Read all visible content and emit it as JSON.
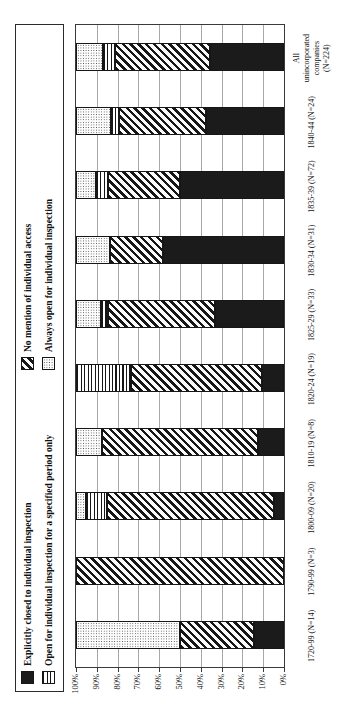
{
  "colors": {
    "pattern_ink": "#161616",
    "bar_black": "#1b1b1b",
    "gridline": "#a8a8a8",
    "plot_border": "#3a3a3a",
    "background": "#ffffff"
  },
  "chart_data": {
    "type": "bar",
    "variant": "100pct-stacked-columns",
    "orientation": "landscape chart rotated 90deg counter-clockwise within portrait image",
    "title": "",
    "xlabel": "",
    "ylabel": "",
    "ylim": [
      0,
      100
    ],
    "grid": true,
    "legend_position": "top",
    "categories": [
      "1720-99 (N=14)",
      "1790-99 (N=3)",
      "1800-09 (N=20)",
      "1810-19 (N=8)",
      "1820-24 (N=19)",
      "1825-29 (N=33)",
      "1830-34 (N=31)",
      "1835-39 (N=72)",
      "1840-44 (N=24)",
      "All unincorporated companies (N=224)"
    ],
    "series": [
      {
        "name": "Explicitly closed to individual inspection",
        "pattern": "solid-black",
        "values": [
          14.3,
          0,
          5,
          12.5,
          10.5,
          33.3,
          58.1,
          50,
          37.5,
          35.7
        ]
      },
      {
        "name": "No mention of individual access",
        "pattern": "diagonal-hatch",
        "values": [
          35.7,
          100,
          80,
          75,
          63.2,
          51.5,
          25.8,
          34.7,
          41.7,
          45.5
        ]
      },
      {
        "name": "Open for individual inspection for a specified period only",
        "pattern": "horizontal-lines",
        "values": [
          0,
          0,
          10,
          0,
          26.3,
          3,
          0,
          5.6,
          4.2,
          5.8
        ]
      },
      {
        "name": "Always open for individual inspection",
        "pattern": "fine-dots",
        "values": [
          50,
          0,
          5,
          12.5,
          0,
          12.1,
          16.1,
          9.7,
          16.7,
          12.9
        ]
      }
    ],
    "stack_order_bottom_to_top": [
      0,
      1,
      2,
      3
    ],
    "y_axis": {
      "ticks_top_to_bottom": [
        "100%",
        "90%",
        "80%",
        "70%",
        "60%",
        "50%",
        "40%",
        "30%",
        "20%",
        "10%",
        "0%"
      ]
    },
    "legend_layout": {
      "column1_series": [
        0,
        2
      ],
      "column2_series": [
        1,
        3
      ]
    }
  }
}
